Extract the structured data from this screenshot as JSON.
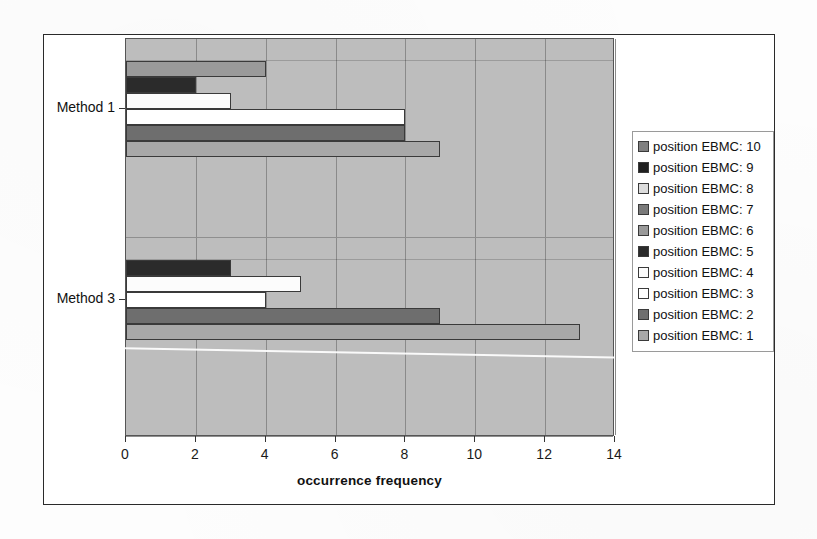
{
  "chart_data": {
    "type": "bar",
    "orientation": "horizontal",
    "title": "",
    "xlabel": "occurrence frequency",
    "ylabel": "",
    "xlim": [
      0,
      14
    ],
    "xticks": [
      0,
      2,
      4,
      6,
      8,
      10,
      12,
      14
    ],
    "xticklabels": [
      "0",
      "2",
      "4",
      "6",
      "8",
      "10",
      "12",
      "14"
    ],
    "categories": [
      "Method 1",
      "Method 3"
    ],
    "grid": "vertical",
    "legend_position": "right",
    "plot_background": "#bdbdbd",
    "series": [
      {
        "name": "position EBMC: 1",
        "color": "#a8a8a8",
        "values": [
          9,
          13
        ]
      },
      {
        "name": "position EBMC: 2",
        "color": "#6e6e6e",
        "values": [
          8,
          9
        ]
      },
      {
        "name": "position EBMC: 3",
        "color": "#ffffff",
        "values": [
          8,
          4
        ]
      },
      {
        "name": "position EBMC: 4",
        "color": "#fcfcfc",
        "values": [
          3,
          5
        ]
      },
      {
        "name": "position EBMC: 5",
        "color": "#2b2b2b",
        "values": [
          2,
          3
        ]
      },
      {
        "name": "position EBMC: 6",
        "color": "#9a9a9a",
        "values": [
          4,
          0
        ]
      },
      {
        "name": "position EBMC: 7",
        "color": "#7a7a7a",
        "values": [
          0,
          0
        ]
      },
      {
        "name": "position EBMC: 8",
        "color": "#dcdcdc",
        "values": [
          0,
          0
        ]
      },
      {
        "name": "position EBMC: 9",
        "color": "#202020",
        "values": [
          0,
          0
        ]
      },
      {
        "name": "position EBMC: 10",
        "color": "#808080",
        "values": [
          0,
          0
        ]
      }
    ]
  },
  "legend": {
    "entries": [
      {
        "label": "position EBMC: 10",
        "color": "#808080"
      },
      {
        "label": "position EBMC: 9",
        "color": "#202020"
      },
      {
        "label": "position EBMC: 8",
        "color": "#dcdcdc"
      },
      {
        "label": "position EBMC: 7",
        "color": "#7a7a7a"
      },
      {
        "label": "position EBMC: 6",
        "color": "#9a9a9a"
      },
      {
        "label": "position EBMC: 5",
        "color": "#2b2b2b"
      },
      {
        "label": "position EBMC: 4",
        "color": "#fcfcfc"
      },
      {
        "label": "position EBMC: 3",
        "color": "#ffffff"
      },
      {
        "label": "position EBMC: 2",
        "color": "#6e6e6e"
      },
      {
        "label": "position EBMC: 1",
        "color": "#a8a8a8"
      }
    ]
  },
  "axis": {
    "x_title": "occurrence frequency",
    "x_tick_labels": [
      "0",
      "2",
      "4",
      "6",
      "8",
      "10",
      "12",
      "14"
    ],
    "y_category_labels": [
      "Method 1",
      "Method 3"
    ]
  }
}
